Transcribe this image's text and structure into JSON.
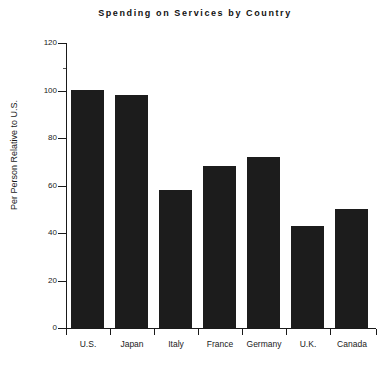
{
  "chart_data": {
    "type": "bar",
    "title": "Spending on Services by Country",
    "xlabel": "",
    "ylabel": "Per Person Relative to U.S.",
    "categories": [
      "U.S.",
      "Japan",
      "Italy",
      "France",
      "Germany",
      "U.K.",
      "Canada"
    ],
    "values": [
      100,
      98,
      58,
      68,
      72,
      43,
      50
    ],
    "ylim": [
      0,
      120
    ],
    "yticks": [
      0,
      20,
      40,
      60,
      80,
      100,
      120
    ],
    "ytick_labels": [
      "0",
      "20",
      "40",
      "60",
      "80",
      "100",
      "120"
    ],
    "grid": false,
    "legend": null,
    "bar_color": "#1c1c1c",
    "axis_color": "#1a1a1a",
    "background": "#ffffff"
  }
}
